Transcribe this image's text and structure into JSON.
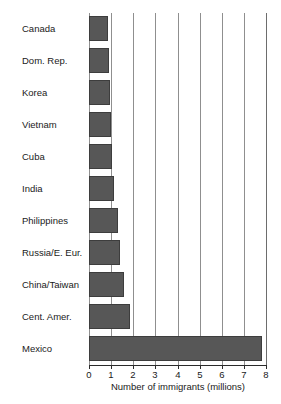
{
  "chart_data": {
    "type": "bar",
    "orientation": "horizontal",
    "title": "",
    "xlabel": "Number of immigrants (millions)",
    "ylabel": "",
    "xlim": [
      0,
      8
    ],
    "xticks": [
      0,
      1,
      2,
      3,
      4,
      5,
      6,
      7,
      8
    ],
    "xticklabels": [
      "0",
      "1",
      "2",
      "3",
      "4",
      "5",
      "6",
      "7",
      "8"
    ],
    "grid": "vertical",
    "legend": "none",
    "bar_color": "#575757",
    "bar_edge_color": "#3d3d3d",
    "gridline_color": "#8f8f8f",
    "axis_color": "#2b2b2b",
    "categories": [
      "Canada",
      "Dom. Rep.",
      "Korea",
      "Vietnam",
      "Cuba",
      "India",
      "Philippines",
      "Russia/E. Eur.",
      "China/Taiwan",
      "Cent. Amer.",
      "Mexico"
    ],
    "values": [
      0.85,
      0.9,
      0.95,
      1.0,
      1.05,
      1.15,
      1.3,
      1.4,
      1.6,
      1.85,
      7.8
    ]
  }
}
